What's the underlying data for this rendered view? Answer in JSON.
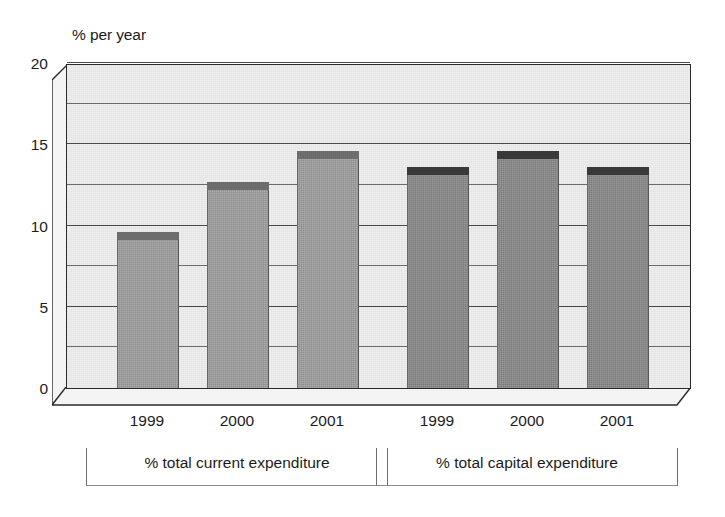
{
  "chart_data": {
    "type": "bar",
    "title": "",
    "subtitle": "",
    "ylabel": "% per year",
    "xlabel": "",
    "ylim": [
      0,
      20
    ],
    "yticks": [
      0,
      5,
      10,
      15,
      20
    ],
    "ytick_labels": [
      "0",
      "5",
      "10",
      "15",
      "20"
    ],
    "minor_gridlines": [
      2.5,
      7.5,
      12.5,
      17.5
    ],
    "grid": true,
    "legend": "none",
    "style": "3d-bar",
    "categories": [
      "1999",
      "2000",
      "2001"
    ],
    "groups": [
      {
        "name": "% total current expenditure",
        "bar_color": "#9c9c9c",
        "cap_color": "#6f6f6f",
        "categories": [
          "1999",
          "2000",
          "2001"
        ],
        "values": [
          9.1,
          12.2,
          14.1
        ]
      },
      {
        "name": "% total capital expenditure",
        "bar_color": "#868686",
        "cap_color": "#3a3a3a",
        "categories": [
          "1999",
          "2000",
          "2001"
        ],
        "values": [
          13.1,
          14.1,
          13.1
        ]
      }
    ]
  },
  "axis": {
    "caption": "% per year"
  },
  "colors": {
    "plot_background": "#eeeeee",
    "axis_line": "#2b2b2b",
    "gridline": "#6d6d6d",
    "text": "#1b1b1b",
    "page_background": "#ffffff"
  }
}
